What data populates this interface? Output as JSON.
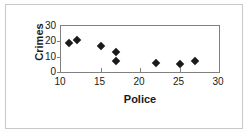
{
  "chart_data": {
    "type": "scatter",
    "title": "",
    "xlabel": "Police",
    "ylabel": "Crimes",
    "xlim": [
      10,
      30
    ],
    "ylim": [
      0,
      30
    ],
    "xticks": [
      10,
      15,
      20,
      25,
      30
    ],
    "yticks": [
      0,
      10,
      20,
      30
    ],
    "grid": false,
    "legend": false,
    "marker": "diamond",
    "marker_color": "#1a1a1a",
    "series": [
      {
        "name": "Crimes vs Police",
        "points": [
          {
            "x": 11,
            "y": 19
          },
          {
            "x": 12,
            "y": 21
          },
          {
            "x": 15,
            "y": 17
          },
          {
            "x": 17,
            "y": 13
          },
          {
            "x": 17,
            "y": 7
          },
          {
            "x": 22,
            "y": 6
          },
          {
            "x": 25,
            "y": 5
          },
          {
            "x": 27,
            "y": 7
          }
        ]
      }
    ]
  },
  "axis": {
    "y_tick_labels": [
      "30",
      "20",
      "10",
      "0"
    ],
    "x_tick_labels": [
      "10",
      "15",
      "20",
      "25",
      "30"
    ],
    "y_title": "Crimes",
    "x_title": "Police"
  }
}
